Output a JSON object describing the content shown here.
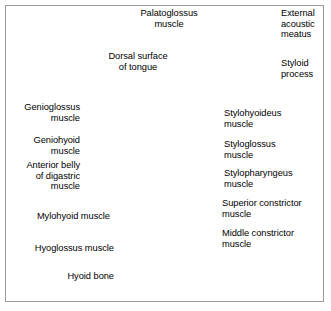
{
  "figure": {
    "style": "grayscale medical illustration with leader-line labels",
    "border_color": "#9a9a9a",
    "background_color": "#ffffff",
    "text_color": "#000000",
    "leader_color": "#555555"
  },
  "labels": [
    {
      "id": "palatoglossus",
      "text": "Palatoglossus\nmuscle",
      "align": "center",
      "x": 122,
      "y": 8,
      "w": 94
    },
    {
      "id": "external-acoustic-meatus",
      "text": "External\nacoustic\nmeatus",
      "align": "left",
      "x": 281,
      "y": 8,
      "w": 50
    },
    {
      "id": "dorsal-surface-tongue",
      "text": "Dorsal surface\nof tongue",
      "align": "center",
      "x": 93,
      "y": 51,
      "w": 90
    },
    {
      "id": "styloid-process",
      "text": "Styloid\nprocess",
      "align": "left",
      "x": 281,
      "y": 58,
      "w": 50
    },
    {
      "id": "genioglossus",
      "text": "Genioglossus\nmuscle",
      "align": "right",
      "x": 2,
      "y": 102,
      "w": 78
    },
    {
      "id": "stylohyoideus",
      "text": "Stylohyoideus\nmuscle",
      "align": "left",
      "x": 224,
      "y": 108,
      "w": 105
    },
    {
      "id": "geniohyoid",
      "text": "Geniohyoid\nmuscle",
      "align": "right",
      "x": 2,
      "y": 135,
      "w": 78
    },
    {
      "id": "styloglossus",
      "text": "Styloglossus\nmuscle",
      "align": "left",
      "x": 224,
      "y": 139,
      "w": 105
    },
    {
      "id": "anterior-belly-digastric",
      "text": "Anterior belly\nof digastric\nmuscle",
      "align": "right",
      "x": 2,
      "y": 160,
      "w": 78
    },
    {
      "id": "stylopharyngeus",
      "text": "Stylopharyngeus\nmuscle",
      "align": "left",
      "x": 224,
      "y": 168,
      "w": 105
    },
    {
      "id": "superior-constrictor",
      "text": "Superior constrictor\nmuscle",
      "align": "left",
      "x": 222,
      "y": 198,
      "w": 108
    },
    {
      "id": "mylohyoid",
      "text": "Mylohyoid muscle",
      "align": "right",
      "x": 2,
      "y": 211,
      "w": 108
    },
    {
      "id": "middle-constrictor",
      "text": "Middle constrictor\nmuscle",
      "align": "left",
      "x": 222,
      "y": 228,
      "w": 108
    },
    {
      "id": "hyoglossus",
      "text": "Hyoglossus muscle",
      "align": "right",
      "x": 2,
      "y": 243,
      "w": 112
    },
    {
      "id": "hyoid-bone",
      "text": "Hyoid bone",
      "align": "right",
      "x": 2,
      "y": 271,
      "w": 112
    }
  ]
}
